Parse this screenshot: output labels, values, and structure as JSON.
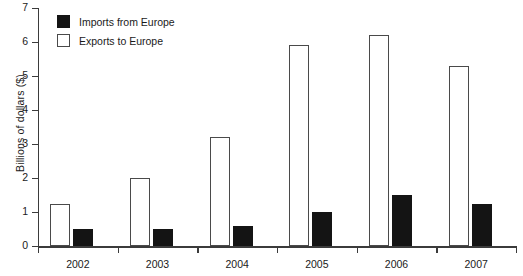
{
  "chart_data": {
    "type": "bar",
    "title": "",
    "subtitle": "",
    "xlabel": "",
    "ylabel": "Billions of dollars ($)",
    "categories": [
      "2002",
      "2003",
      "2004",
      "2005",
      "2006",
      "2007"
    ],
    "series": [
      {
        "name": "Exports to Europe",
        "color": "#ffffff",
        "edge_color": "#4a4a4a",
        "values": [
          1.25,
          2.0,
          3.2,
          5.9,
          6.2,
          5.3
        ]
      },
      {
        "name": "Imports from Europe",
        "color": "#141414",
        "edge_color": "#141414",
        "values": [
          0.5,
          0.5,
          0.6,
          1.0,
          1.5,
          1.25
        ]
      }
    ],
    "ylim": [
      0,
      7
    ],
    "yticks": [
      0,
      1,
      2,
      3,
      4,
      5,
      6,
      7
    ],
    "ytick_labels": [
      "0",
      "1",
      "2",
      "3",
      "4",
      "5",
      "6",
      "7"
    ],
    "grid": false,
    "legend_position": "upper-left",
    "legend_order": [
      "Imports from Europe",
      "Exports to Europe"
    ],
    "bar_draw_order": [
      "Exports to Europe",
      "Imports from Europe"
    ]
  },
  "legend": {
    "items": [
      {
        "label": "Imports from Europe",
        "swatch": "filled-black-square"
      },
      {
        "label": "Exports to Europe",
        "swatch": "outlined-white-square"
      }
    ]
  }
}
